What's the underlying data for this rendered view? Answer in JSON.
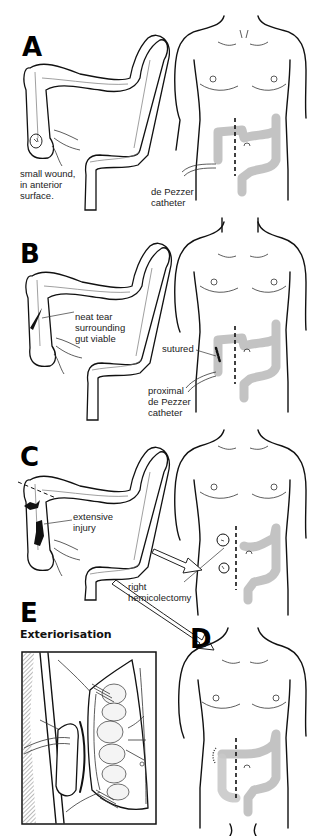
{
  "figure": {
    "panels": [
      {
        "id": "A",
        "letter": "A",
        "labels": {
          "wound": "small wound,\nin anterior\nsurface.",
          "catheter": "de Pezzer\ncatheter"
        }
      },
      {
        "id": "B",
        "letter": "B",
        "labels": {
          "tear": "neat tear\nsurrounding\ngut viable",
          "sutured": "sutured",
          "catheter": "proximal\nde Pezzer\ncatheter"
        }
      },
      {
        "id": "C",
        "letter": "C",
        "labels": {
          "injury": "extensive\ninjury",
          "procedure": "right\nhemicolectomy"
        }
      },
      {
        "id": "D",
        "letter": "D",
        "labels": {}
      },
      {
        "id": "E",
        "letter": "E",
        "subtitle": "Exteriorisation",
        "labels": {}
      }
    ],
    "icons": {
      "colon": "colon-illustration",
      "torso": "torso-illustration",
      "arrow": "hollow-arrow"
    }
  }
}
